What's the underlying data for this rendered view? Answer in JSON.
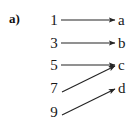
{
  "figure": {
    "part_label": "a)",
    "ink_color": "#242424",
    "background_color": "#ffffff"
  },
  "chart_data": {
    "type": "diagram",
    "title": "a)",
    "diagram_kind": "arrow-mapping-diagram",
    "xlabel": "",
    "ylabel": "",
    "grid": false,
    "legend": "none",
    "domain_nodes": [
      {
        "label": "1",
        "x": 54,
        "y": 20
      },
      {
        "label": "3",
        "x": 54,
        "y": 43
      },
      {
        "label": "5",
        "x": 54,
        "y": 65
      },
      {
        "label": "7",
        "x": 54,
        "y": 88
      },
      {
        "label": "9",
        "x": 54,
        "y": 112
      }
    ],
    "codomain_nodes": [
      {
        "label": "a",
        "x": 122,
        "y": 20
      },
      {
        "label": "b",
        "x": 122,
        "y": 43
      },
      {
        "label": "c",
        "x": 122,
        "y": 65
      },
      {
        "label": "d",
        "x": 122,
        "y": 88
      }
    ],
    "arrows": [
      {
        "from": "1",
        "to": "a",
        "x1": 61,
        "y1": 20,
        "x2": 115,
        "y2": 20
      },
      {
        "from": "3",
        "to": "b",
        "x1": 61,
        "y1": 43,
        "x2": 115,
        "y2": 43
      },
      {
        "from": "5",
        "to": "c",
        "x1": 61,
        "y1": 65,
        "x2": 115,
        "y2": 65
      },
      {
        "from": "7",
        "to": "c",
        "x1": 62,
        "y1": 92,
        "x2": 115,
        "y2": 66
      },
      {
        "from": "9",
        "to": "d",
        "x1": 62,
        "y1": 115,
        "x2": 115,
        "y2": 89
      }
    ]
  }
}
